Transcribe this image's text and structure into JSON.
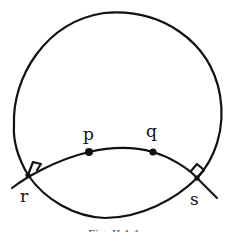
{
  "figure": {
    "type": "hand-drawn geometric diagram",
    "caption": "Fig. II.1.1",
    "labels": {
      "p": "p",
      "q": "q",
      "r": "r",
      "s": "s"
    },
    "elements": {
      "outer_circle": "circle",
      "upper_arc": "arc through p and q meeting circle at r and s with right-angle marks",
      "lower_arc": "arc from r to s inside circle"
    },
    "colors": {
      "ink": "#111111",
      "background": "#ffffff"
    }
  }
}
